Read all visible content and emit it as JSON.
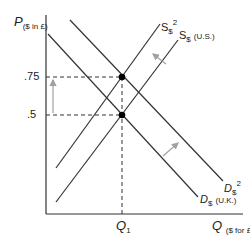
{
  "diagram": {
    "y_axis": {
      "symbol": "P",
      "unit": "($ in £)"
    },
    "x_axis": {
      "symbol": "Q",
      "unit": "($ for £)"
    },
    "price_ticks": [
      ".75",
      ".5"
    ],
    "quantity_tick": {
      "symbol": "Q",
      "subscript": "1"
    },
    "curves": {
      "supply_original": {
        "symbol": "S",
        "subscript": "$",
        "note": "(U.S.)"
      },
      "supply_new": {
        "symbol": "S",
        "subscript": "$",
        "superscript": "2"
      },
      "demand_original": {
        "symbol": "D",
        "subscript": "$",
        "note": "(U.K.)"
      },
      "demand_new": {
        "symbol": "D",
        "subscript": "$",
        "superscript": "2"
      }
    },
    "colors": {
      "curve": "#333333",
      "dashed": "#333333",
      "arrow": "#a0a0a0",
      "point": "#000000"
    }
  }
}
